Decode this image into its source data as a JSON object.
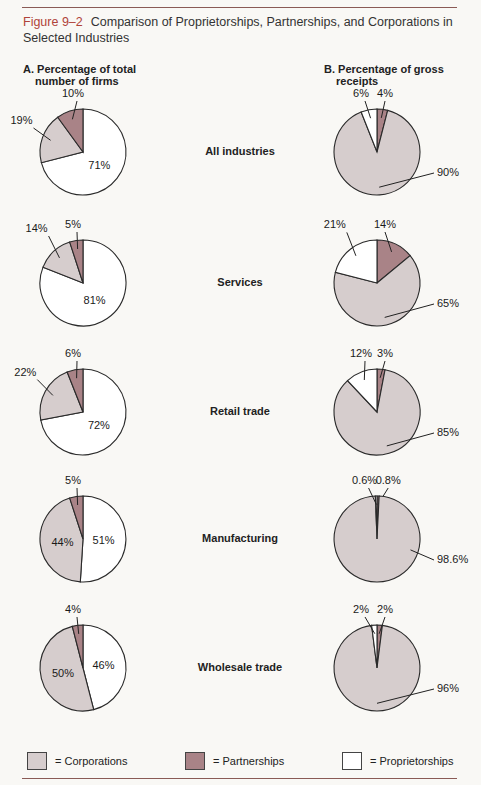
{
  "figure": {
    "number": "Figure 9–2",
    "title": "Comparison of Proprietorships, Partnerships, and Corporations in Selected Industries"
  },
  "columns": {
    "a": {
      "line1": "A. Percentage of total",
      "line2": "number of firms"
    },
    "b": {
      "line1": "B. Percentage of gross",
      "line2": "receipts"
    }
  },
  "colors": {
    "corporations": "#d6cdcd",
    "partnerships": "#a98387",
    "proprietorships": "#ffffff",
    "accent": "#b0433a"
  },
  "legend": [
    {
      "key": "corporations",
      "label": "= Corporations"
    },
    {
      "key": "partnerships",
      "label": "= Partnerships"
    },
    {
      "key": "proprietorships",
      "label": "= Proprietorships"
    }
  ],
  "chart_data": [
    {
      "type": "pie",
      "title": "A. Percentage of total number of firms",
      "categories": [
        "All industries",
        "Services",
        "Retail trade",
        "Manufacturing",
        "Wholesale trade"
      ],
      "series": [
        {
          "name": "Proprietorships",
          "values": [
            71,
            81,
            72,
            51,
            46
          ]
        },
        {
          "name": "Corporations",
          "values": [
            19,
            14,
            22,
            44,
            50
          ]
        },
        {
          "name": "Partnerships",
          "values": [
            10,
            5,
            6,
            5,
            4
          ]
        }
      ],
      "labels": [
        [
          "71%",
          "19%",
          "10%"
        ],
        [
          "81%",
          "14%",
          "5%"
        ],
        [
          "72%",
          "22%",
          "6%"
        ],
        [
          "51%",
          "44%",
          "5%"
        ],
        [
          "46%",
          "50%",
          "4%"
        ]
      ]
    },
    {
      "type": "pie",
      "title": "B. Percentage of gross receipts",
      "categories": [
        "All industries",
        "Services",
        "Retail trade",
        "Manufacturing",
        "Wholesale trade"
      ],
      "series": [
        {
          "name": "Partnerships",
          "values": [
            4,
            14,
            3,
            0.8,
            2
          ]
        },
        {
          "name": "Corporations",
          "values": [
            90,
            65,
            85,
            98.6,
            96
          ]
        },
        {
          "name": "Proprietorships",
          "values": [
            6,
            21,
            12,
            0.6,
            2
          ]
        }
      ],
      "labels": [
        [
          "4%",
          "90%",
          "6%"
        ],
        [
          "14%",
          "65%",
          "21%"
        ],
        [
          "3%",
          "85%",
          "12%"
        ],
        [
          "0.8%",
          "98.6%",
          "0.6%"
        ],
        [
          "2%",
          "96%",
          "2%"
        ]
      ]
    }
  ],
  "industries": [
    "All industries",
    "Services",
    "Retail trade",
    "Manufacturing",
    "Wholesale trade"
  ]
}
